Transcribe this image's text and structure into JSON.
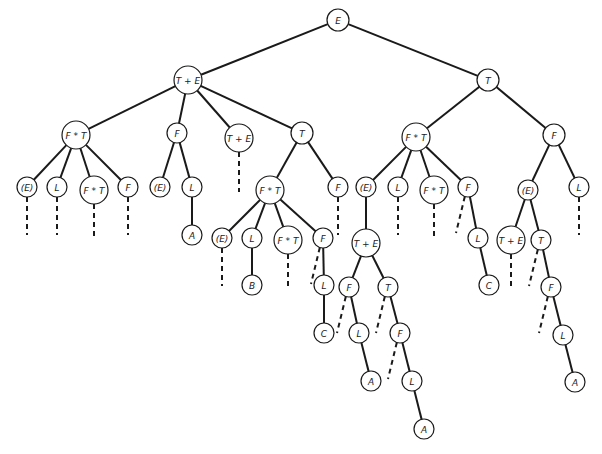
{
  "diagram": {
    "type": "parse-tree",
    "nodes": [
      {
        "id": "n0",
        "label": "E",
        "x": 338,
        "y": 20,
        "r": 11
      },
      {
        "id": "n1",
        "label": "T + E",
        "x": 188,
        "y": 80,
        "r": 14
      },
      {
        "id": "n2",
        "label": "T",
        "x": 488,
        "y": 80,
        "r": 11
      },
      {
        "id": "n3",
        "label": "F * T",
        "x": 76,
        "y": 135,
        "r": 14
      },
      {
        "id": "n4",
        "label": "F",
        "x": 177,
        "y": 133,
        "r": 10
      },
      {
        "id": "n5",
        "label": "T + E",
        "x": 239,
        "y": 138,
        "r": 14
      },
      {
        "id": "n6",
        "label": "T",
        "x": 302,
        "y": 133,
        "r": 11
      },
      {
        "id": "n7",
        "label": "F * T",
        "x": 416,
        "y": 137,
        "r": 14
      },
      {
        "id": "n8",
        "label": "F",
        "x": 554,
        "y": 135,
        "r": 11
      },
      {
        "id": "n9",
        "label": "(E)",
        "x": 27,
        "y": 187,
        "r": 10
      },
      {
        "id": "n10",
        "label": "L",
        "x": 57,
        "y": 187,
        "r": 10
      },
      {
        "id": "n11",
        "label": "F * T",
        "x": 94,
        "y": 190,
        "r": 14
      },
      {
        "id": "n12",
        "label": "F",
        "x": 128,
        "y": 187,
        "r": 10
      },
      {
        "id": "n13",
        "label": "(E)",
        "x": 160,
        "y": 187,
        "r": 10
      },
      {
        "id": "n14",
        "label": "L",
        "x": 192,
        "y": 187,
        "r": 10
      },
      {
        "id": "n15",
        "label": "A",
        "x": 192,
        "y": 235,
        "r": 10
      },
      {
        "id": "n16",
        "label": "F * T",
        "x": 270,
        "y": 190,
        "r": 14
      },
      {
        "id": "n17",
        "label": "F",
        "x": 338,
        "y": 187,
        "r": 10
      },
      {
        "id": "n18",
        "label": "(E)",
        "x": 222,
        "y": 238,
        "r": 10
      },
      {
        "id": "n19",
        "label": "L",
        "x": 252,
        "y": 238,
        "r": 10
      },
      {
        "id": "n20",
        "label": "B",
        "x": 252,
        "y": 285,
        "r": 10
      },
      {
        "id": "n21",
        "label": "F * T",
        "x": 288,
        "y": 240,
        "r": 14
      },
      {
        "id": "n22",
        "label": "F",
        "x": 323,
        "y": 238,
        "r": 10
      },
      {
        "id": "n23",
        "label": "L",
        "x": 324,
        "y": 285,
        "r": 10
      },
      {
        "id": "n24",
        "label": "C",
        "x": 324,
        "y": 333,
        "r": 10
      },
      {
        "id": "n25",
        "label": "(E)",
        "x": 366,
        "y": 187,
        "r": 10
      },
      {
        "id": "n26",
        "label": "L",
        "x": 398,
        "y": 187,
        "r": 10
      },
      {
        "id": "n27",
        "label": "F * T",
        "x": 434,
        "y": 190,
        "r": 14
      },
      {
        "id": "n28",
        "label": "F",
        "x": 468,
        "y": 187,
        "r": 10
      },
      {
        "id": "n29",
        "label": "L",
        "x": 478,
        "y": 238,
        "r": 10
      },
      {
        "id": "n30",
        "label": "C",
        "x": 489,
        "y": 285,
        "r": 10
      },
      {
        "id": "n31",
        "label": "T + E",
        "x": 366,
        "y": 243,
        "r": 14
      },
      {
        "id": "n32",
        "label": "F",
        "x": 349,
        "y": 287,
        "r": 10
      },
      {
        "id": "n33",
        "label": "L",
        "x": 359,
        "y": 333,
        "r": 10
      },
      {
        "id": "n34",
        "label": "A",
        "x": 371,
        "y": 381,
        "r": 10
      },
      {
        "id": "n35",
        "label": "T",
        "x": 388,
        "y": 287,
        "r": 10
      },
      {
        "id": "n36",
        "label": "F",
        "x": 400,
        "y": 333,
        "r": 10
      },
      {
        "id": "n37",
        "label": "L",
        "x": 412,
        "y": 381,
        "r": 10
      },
      {
        "id": "n38",
        "label": "A",
        "x": 424,
        "y": 429,
        "r": 10
      },
      {
        "id": "n39",
        "label": "(E)",
        "x": 528,
        "y": 190,
        "r": 10
      },
      {
        "id": "n40",
        "label": "L",
        "x": 579,
        "y": 187,
        "r": 10
      },
      {
        "id": "n41",
        "label": "T + E",
        "x": 511,
        "y": 240,
        "r": 14
      },
      {
        "id": "n42",
        "label": "T",
        "x": 541,
        "y": 240,
        "r": 10
      },
      {
        "id": "n43",
        "label": "F",
        "x": 551,
        "y": 287,
        "r": 10
      },
      {
        "id": "n44",
        "label": "L",
        "x": 563,
        "y": 335,
        "r": 10
      },
      {
        "id": "n45",
        "label": "A",
        "x": 575,
        "y": 382,
        "r": 10
      }
    ],
    "edges": [
      {
        "from": "n0",
        "to": "n1"
      },
      {
        "from": "n0",
        "to": "n2"
      },
      {
        "from": "n1",
        "to": "n3"
      },
      {
        "from": "n1",
        "to": "n4"
      },
      {
        "from": "n1",
        "to": "n5"
      },
      {
        "from": "n1",
        "to": "n6"
      },
      {
        "from": "n2",
        "to": "n7"
      },
      {
        "from": "n2",
        "to": "n8"
      },
      {
        "from": "n3",
        "to": "n9"
      },
      {
        "from": "n3",
        "to": "n10"
      },
      {
        "from": "n3",
        "to": "n11"
      },
      {
        "from": "n3",
        "to": "n12"
      },
      {
        "from": "n4",
        "to": "n13"
      },
      {
        "from": "n4",
        "to": "n14"
      },
      {
        "from": "n14",
        "to": "n15"
      },
      {
        "from": "n6",
        "to": "n16"
      },
      {
        "from": "n6",
        "to": "n17"
      },
      {
        "from": "n16",
        "to": "n18"
      },
      {
        "from": "n16",
        "to": "n19"
      },
      {
        "from": "n19",
        "to": "n20"
      },
      {
        "from": "n16",
        "to": "n21"
      },
      {
        "from": "n16",
        "to": "n22"
      },
      {
        "from": "n22",
        "to": "n23"
      },
      {
        "from": "n23",
        "to": "n24"
      },
      {
        "from": "n7",
        "to": "n25"
      },
      {
        "from": "n7",
        "to": "n26"
      },
      {
        "from": "n7",
        "to": "n27"
      },
      {
        "from": "n7",
        "to": "n28"
      },
      {
        "from": "n28",
        "to": "n29"
      },
      {
        "from": "n29",
        "to": "n30"
      },
      {
        "from": "n25",
        "to": "n31"
      },
      {
        "from": "n31",
        "to": "n32"
      },
      {
        "from": "n32",
        "to": "n33"
      },
      {
        "from": "n33",
        "to": "n34"
      },
      {
        "from": "n31",
        "to": "n35"
      },
      {
        "from": "n35",
        "to": "n36"
      },
      {
        "from": "n36",
        "to": "n37"
      },
      {
        "from": "n37",
        "to": "n38"
      },
      {
        "from": "n8",
        "to": "n39"
      },
      {
        "from": "n8",
        "to": "n40"
      },
      {
        "from": "n39",
        "to": "n41"
      },
      {
        "from": "n39",
        "to": "n42"
      },
      {
        "from": "n42",
        "to": "n43"
      },
      {
        "from": "n43",
        "to": "n44"
      },
      {
        "from": "n44",
        "to": "n45"
      }
    ],
    "dashed_stubs": [
      {
        "from": "n9",
        "dx": 0,
        "dy": 38
      },
      {
        "from": "n10",
        "dx": 0,
        "dy": 38
      },
      {
        "from": "n11",
        "dx": 0,
        "dy": 36
      },
      {
        "from": "n12",
        "dx": 0,
        "dy": 38
      },
      {
        "from": "n5",
        "dx": 0,
        "dy": 40
      },
      {
        "from": "n17",
        "dx": 0,
        "dy": 38
      },
      {
        "from": "n18",
        "dx": 0,
        "dy": 38
      },
      {
        "from": "n21",
        "dx": 0,
        "dy": 36
      },
      {
        "from": "n22",
        "dx": -12,
        "dy": 36
      },
      {
        "from": "n26",
        "dx": 0,
        "dy": 38
      },
      {
        "from": "n27",
        "dx": 0,
        "dy": 36
      },
      {
        "from": "n28",
        "dx": -12,
        "dy": 36
      },
      {
        "from": "n32",
        "dx": -12,
        "dy": 36
      },
      {
        "from": "n35",
        "dx": -12,
        "dy": 36
      },
      {
        "from": "n36",
        "dx": -12,
        "dy": 36
      },
      {
        "from": "n40",
        "dx": 0,
        "dy": 38
      },
      {
        "from": "n41",
        "dx": 0,
        "dy": 36
      },
      {
        "from": "n42",
        "dx": -12,
        "dy": 36
      },
      {
        "from": "n43",
        "dx": -12,
        "dy": 36
      }
    ],
    "colors": {
      "line": "#1a1a1a",
      "node_fill": "#ffffff",
      "text": "#222222",
      "background": "#ffffff"
    }
  }
}
